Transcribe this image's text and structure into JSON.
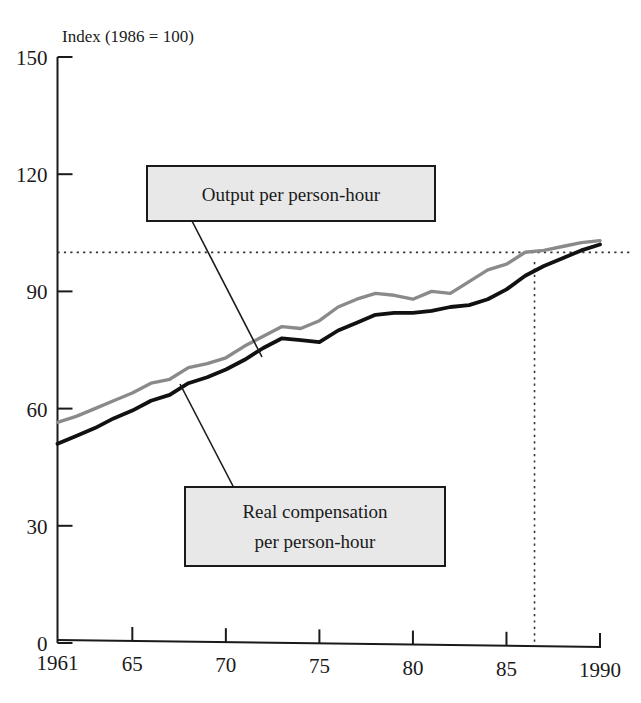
{
  "figure": {
    "axis_title": "Index (1986 = 100)",
    "x_axis_name": "Year",
    "y_axis_name": "Index (1986 = 100)"
  },
  "annotations": {
    "output_box": {
      "line1": "Output per person-hour"
    },
    "compensation_box": {
      "line1": "Real compensation",
      "line2": "per person-hour"
    }
  },
  "colors": {
    "output_line": "#8a8a8a",
    "compensation_line": "#111111",
    "box_fill": "#e8e8e8",
    "box_border": "#1a1a1a",
    "axis": "#1a1a1a",
    "reference_line": "#333333"
  },
  "chart_data": {
    "type": "line",
    "title": "Index (1986 = 100)",
    "xlabel": "",
    "ylabel": "Index (1986 = 100)",
    "xlim": [
      1961,
      1990
    ],
    "ylim": [
      0,
      150
    ],
    "grid": false,
    "legend": "callout-boxes",
    "y_ticks": [
      0,
      30,
      60,
      90,
      120,
      150
    ],
    "x_ticks": [
      1961,
      1965,
      1970,
      1975,
      1980,
      1985,
      1990
    ],
    "x_tick_labels": [
      "1961",
      "65",
      "70",
      "75",
      "80",
      "85",
      "1990"
    ],
    "reference_lines": [
      {
        "orientation": "horizontal",
        "value": 100,
        "style": "dotted"
      },
      {
        "orientation": "vertical",
        "value": 1986.5,
        "style": "dotted"
      }
    ],
    "x": [
      1961,
      1962,
      1963,
      1964,
      1965,
      1966,
      1967,
      1968,
      1969,
      1970,
      1971,
      1972,
      1973,
      1974,
      1975,
      1976,
      1977,
      1978,
      1979,
      1980,
      1981,
      1982,
      1983,
      1984,
      1985,
      1986,
      1987,
      1988,
      1989,
      1990
    ],
    "series": [
      {
        "name": "Output per person-hour",
        "color": "#8a8a8a",
        "values": [
          56.5,
          58.0,
          60.0,
          62.0,
          64.0,
          66.5,
          67.5,
          70.5,
          71.5,
          73.0,
          76.0,
          78.5,
          81.0,
          80.5,
          82.5,
          86.0,
          88.0,
          89.5,
          89.0,
          88.0,
          90.0,
          89.5,
          92.5,
          95.5,
          97.0,
          100.0,
          100.5,
          101.5,
          102.5,
          103.0
        ]
      },
      {
        "name": "Real compensation per person-hour",
        "color": "#111111",
        "values": [
          51.0,
          53.0,
          55.0,
          57.5,
          59.5,
          62.0,
          63.5,
          66.5,
          68.0,
          70.0,
          72.5,
          75.5,
          78.0,
          77.5,
          77.0,
          80.0,
          82.0,
          84.0,
          84.5,
          84.5,
          85.0,
          86.0,
          86.5,
          88.0,
          90.5,
          94.0,
          96.5,
          98.5,
          100.5,
          102.0
        ]
      }
    ]
  }
}
